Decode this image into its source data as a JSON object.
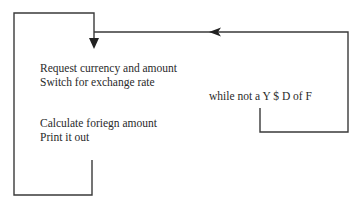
{
  "diagram": {
    "type": "flowchart-loop",
    "colors": {
      "line": "#3a3a3a",
      "text": "#2a2a2a",
      "background": "#ffffff"
    },
    "blocks": [
      {
        "id": "request",
        "lines": [
          "Request currency and amount",
          "Switch for exchange rate"
        ]
      },
      {
        "id": "calculate",
        "lines": [
          "Calculate foriegn amount",
          "Print it out"
        ]
      }
    ],
    "loop_condition": "while not a Y $ D of F",
    "arrows": [
      {
        "from": "loop-return",
        "to": "request",
        "direction": "down"
      },
      {
        "from": "loop-condition",
        "to": "request",
        "direction": "left"
      }
    ]
  }
}
